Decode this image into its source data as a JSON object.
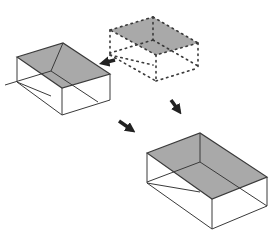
{
  "diagram": {
    "colors": {
      "background": "#ffffff",
      "face_fill": "#a9a9a9",
      "edge": "#3a3a3a",
      "arrow": "#222222"
    },
    "boxes": [
      {
        "id": "box-left",
        "style": "solid",
        "top": [
          [
            17,
            57
          ],
          [
            63,
            43
          ],
          [
            110,
            74
          ],
          [
            62,
            88
          ]
        ],
        "bottom": [
          [
            17,
            82
          ],
          [
            62,
            115
          ],
          [
            110,
            100
          ]
        ],
        "inner": [
          51,
          71
        ]
      },
      {
        "id": "box-dashed",
        "style": "dashed",
        "top": [
          [
            110,
            30
          ],
          [
            153,
            17
          ],
          [
            198,
            43
          ],
          [
            156,
            55
          ]
        ],
        "bottom": [
          [
            110,
            55
          ],
          [
            156,
            81
          ],
          [
            198,
            68
          ]
        ],
        "inner": [
          153,
          40
        ]
      },
      {
        "id": "box-large",
        "style": "solid",
        "top": [
          [
            147,
            153
          ],
          [
            200,
            133
          ],
          [
            267,
            177
          ],
          [
            212,
            199
          ]
        ],
        "bottom": [
          [
            147,
            183
          ],
          [
            212,
            229
          ],
          [
            267,
            206
          ]
        ],
        "inner": [
          200,
          162
        ]
      }
    ],
    "arrows": [
      {
        "id": "arrow-to-left",
        "from": [
          115,
          60
        ],
        "to": [
          103,
          63
        ]
      },
      {
        "id": "arrow-to-large",
        "from": [
          171,
          100
        ],
        "to": [
          179,
          111
        ]
      },
      {
        "id": "arrow-down-left",
        "from": [
          119,
          121
        ],
        "to": [
          132,
          130
        ]
      }
    ]
  }
}
